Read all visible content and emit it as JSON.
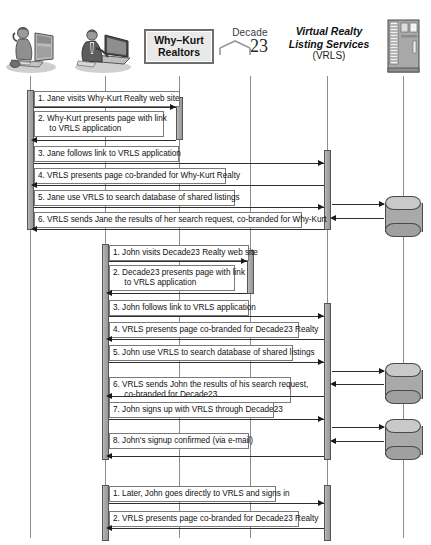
{
  "diagram": {
    "type": "sequence-diagram"
  },
  "participants": [
    {
      "id": "jane",
      "label": "",
      "icon": "person-at-desktop-icon",
      "x": 30,
      "kind": "actor"
    },
    {
      "id": "john",
      "label": "",
      "icon": "person-at-laptop-icon",
      "x": 105,
      "kind": "actor"
    },
    {
      "id": "whykurt",
      "label": "Why–Kurt\nRealtors",
      "icon": "why-kurt-logo",
      "x": 179,
      "kind": "logo-box"
    },
    {
      "id": "decade23",
      "label": "Decade",
      "label2": "23",
      "icon": "decade23-logo",
      "x": 250,
      "kind": "decade-logo"
    },
    {
      "id": "vrls",
      "label": "Virtual Realty\nListing Services",
      "label2": "(VRLS)",
      "icon": "vrls-title",
      "x": 327,
      "kind": "title"
    },
    {
      "id": "server",
      "label": "",
      "icon": "server-tower-icon",
      "x": 403,
      "kind": "system"
    }
  ],
  "sections": [
    {
      "id": "jane-flow",
      "messages": [
        {
          "n": "1.",
          "text": "1. Jane visits Why-Kurt Realty web site",
          "from": "jane",
          "to": "whykurt"
        },
        {
          "n": "2.",
          "text": "2. Why-Kurt presents page with link\n     to VRLS application",
          "from": "whykurt",
          "to": "jane"
        },
        {
          "n": "3.",
          "text": "3. Jane follows link to VRLS application",
          "from": "jane",
          "to": "vrls"
        },
        {
          "n": "4.",
          "text": "4. VRLS presents page co-branded for Why-Kurt Realty",
          "from": "vrls",
          "to": "jane"
        },
        {
          "n": "5.",
          "text": "5. Jane use VRLS to search database of shared listings",
          "from": "jane",
          "to": "vrls"
        },
        {
          "n": "6.",
          "text": "6. VRLS sends Jane the results of her search request, co-branded for Why-Kurt",
          "from": "vrls",
          "to": "jane"
        }
      ]
    },
    {
      "id": "john-flow",
      "messages": [
        {
          "n": "1.",
          "text": "1. John visits Decade23 Realty web site",
          "from": "john",
          "to": "decade23"
        },
        {
          "n": "2.",
          "text": "2. Decade23 presents page with link\n     to VRLS application",
          "from": "decade23",
          "to": "john"
        },
        {
          "n": "3.",
          "text": "3. John follows link to VRLS application",
          "from": "john",
          "to": "vrls"
        },
        {
          "n": "4.",
          "text": "4. VRLS presents page co-branded for Decade23 Realty",
          "from": "vrls",
          "to": "john"
        },
        {
          "n": "5.",
          "text": "5. John use VRLS to search database of shared listings",
          "from": "john",
          "to": "vrls"
        },
        {
          "n": "6.",
          "text": "6. VRLS sends John the results of his search request,\n     co-branded for Decade23",
          "from": "vrls",
          "to": "john"
        },
        {
          "n": "7.",
          "text": "7. John signs up with VRLS through Decade23",
          "from": "john",
          "to": "vrls"
        },
        {
          "n": "8.",
          "text": "8. John's signup confirmed (via e-mail)",
          "from": "vrls",
          "to": "john"
        }
      ]
    },
    {
      "id": "john-return-flow",
      "messages": [
        {
          "n": "1.",
          "text": "1. Later, John goes directly to VRLS and signs in",
          "from": "john",
          "to": "vrls"
        },
        {
          "n": "2.",
          "text": "2. VRLS presents page co-branded for Decade23 Realty",
          "from": "vrls",
          "to": "john"
        }
      ]
    }
  ],
  "databases": [
    {
      "id": "db-jane",
      "label": ""
    },
    {
      "id": "db-john-1",
      "label": ""
    },
    {
      "id": "db-john-2",
      "label": ""
    }
  ],
  "colors": {
    "line": "#2e2e2e",
    "lifeline": "#8d8d8d",
    "activation_fill": "#aaaaaa",
    "label_border": "#7a7a7a",
    "label_bg": "#ffffff",
    "logo_bg": "#e9e9e9",
    "db_fill": "#a9a9a9"
  }
}
